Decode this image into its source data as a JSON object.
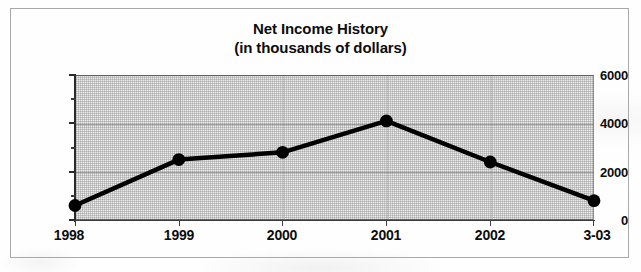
{
  "chart_data": {
    "type": "line",
    "title": "Net Income History",
    "subtitle": "(in thousands of dollars)",
    "xlabel": "",
    "ylabel": "",
    "categories": [
      "1998",
      "1999",
      "2000",
      "2001",
      "2002",
      "3-03"
    ],
    "values": [
      600,
      2500,
      2800,
      4100,
      2400,
      800
    ],
    "series": [
      {
        "name": "Net Income",
        "values": [
          600,
          2500,
          2800,
          4100,
          2400,
          800
        ]
      }
    ],
    "ylim": [
      0,
      6000
    ],
    "y_major_ticks": [
      "0",
      "2000",
      "4000",
      "6000"
    ],
    "y_major_tick_values": [
      0,
      2000,
      4000,
      6000
    ],
    "y_minor_tick_values": [
      1000,
      3000,
      5000
    ],
    "grid": true,
    "grid_axis": "y",
    "legend": false,
    "legend_position": "none",
    "marker": "filled-circle",
    "line_color": "#000000",
    "marker_color": "#000000",
    "plot_background": "#eaeaea",
    "annotations": []
  },
  "figure": {
    "border_color": "#a9a9a9",
    "page_background": "#fefefe"
  }
}
